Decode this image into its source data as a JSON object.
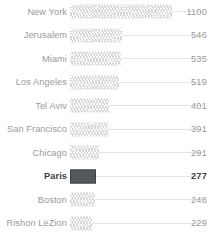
{
  "chart_data": {
    "type": "bar",
    "orientation": "horizontal",
    "title": "",
    "subtitle": "",
    "xlabel": "",
    "ylabel": "",
    "grid": false,
    "legend": null,
    "axis_visible": false,
    "value_labels_position": "right",
    "categories": [
      "New York",
      "Jerusalem",
      "Miami",
      "Los Angeles",
      "Tel Aviv",
      "San Francisco",
      "Chicago",
      "Paris",
      "Boston",
      "Rishon LeZion"
    ],
    "values": [
      1100,
      546,
      535,
      519,
      401,
      391,
      291,
      277,
      248,
      229
    ],
    "value_text": [
      "1100",
      "546",
      "535",
      "519",
      "401",
      "391",
      "291",
      "277",
      "248",
      "229"
    ],
    "bar_pixel_widths": [
      102,
      52,
      51,
      49,
      39,
      38,
      29,
      26,
      25,
      22
    ],
    "highlighted": [
      "Paris"
    ],
    "xlim": [
      0,
      1100
    ]
  },
  "style": {
    "bar_hatch": "crosshatch-zigzag",
    "bar_fill": "#fbfbfb",
    "bar_hatch_color": "#d2d2d2",
    "highlight_fill": "#55585b",
    "highlight_border": "#3f4245",
    "connector_color": "#e4e4e4",
    "label_color": "#9a9a9a",
    "highlight_label_color": "#3d3d3d",
    "background": "#ffffff"
  }
}
